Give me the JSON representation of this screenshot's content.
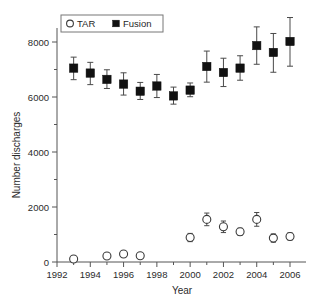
{
  "chart_data": {
    "type": "scatter",
    "title": "",
    "xlabel": "Year",
    "ylabel": "Number discharges",
    "xlim": [
      1992,
      2006.6
    ],
    "ylim": [
      0,
      8800
    ],
    "grid": false,
    "legend_position": "top-left-inside",
    "x_ticks_major": [
      1992,
      1994,
      1996,
      1998,
      2000,
      2002,
      2004,
      2006
    ],
    "x_ticklabels": [
      "1992",
      "1994",
      "1996",
      "1998",
      "2000",
      "2002",
      "2004",
      "2006"
    ],
    "x_ticks_minor": [
      1993,
      1995,
      1997,
      1999,
      2001,
      2003,
      2005
    ],
    "y_ticks_major": [
      0,
      2000,
      4000,
      6000,
      8000
    ],
    "y_ticklabels": [
      "0",
      "2000",
      "4000",
      "6000",
      "8000"
    ],
    "y_ticks_minor": [
      1000,
      3000,
      5000,
      7000
    ],
    "error_type": "95% confidence interval",
    "series": [
      {
        "name": "TAR",
        "marker": "open-circle",
        "color": "#ffffff",
        "edge_color": "#3a3a3a",
        "x": [
          1993,
          1995,
          1996,
          1997,
          2000,
          2001,
          2002,
          2003,
          2004,
          2005,
          2006
        ],
        "values": [
          110,
          220,
          290,
          230,
          890,
          1550,
          1280,
          1100,
          1550,
          870,
          930
        ],
        "err_low": [
          60,
          70,
          90,
          70,
          150,
          230,
          210,
          130,
          250,
          150,
          130
        ],
        "err_high": [
          60,
          70,
          90,
          70,
          150,
          230,
          210,
          130,
          250,
          150,
          130
        ]
      },
      {
        "name": "Fusion",
        "marker": "filled-square",
        "color": "#111111",
        "edge_color": "#111111",
        "x": [
          1993,
          1994,
          1995,
          1996,
          1997,
          1998,
          1999,
          2000,
          2001,
          2002,
          2003,
          2004,
          2005,
          2006
        ],
        "values": [
          7050,
          6870,
          6640,
          6470,
          6210,
          6400,
          6040,
          6250,
          7110,
          6890,
          7050,
          7870,
          7620,
          8020
        ],
        "err_low": [
          420,
          420,
          330,
          400,
          300,
          420,
          300,
          240,
          570,
          510,
          440,
          680,
          720,
          900
        ],
        "err_high": [
          400,
          390,
          350,
          410,
          320,
          420,
          320,
          260,
          560,
          520,
          450,
          680,
          690,
          870
        ]
      }
    ]
  },
  "legend": {
    "entries": [
      {
        "label": "TAR",
        "marker": "open-circle"
      },
      {
        "label": "Fusion",
        "marker": "filled-square"
      }
    ]
  },
  "axis_labels": {
    "x": "Year",
    "y": "Number discharges"
  }
}
